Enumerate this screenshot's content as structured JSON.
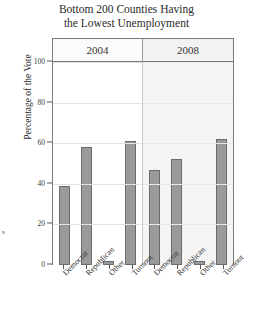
{
  "chart_data": {
    "type": "bar",
    "title": "Bottom 200 Counties Having the Lowest Unemployment",
    "title_lines": [
      "Bottom 200 Counties Having",
      "the Lowest Unemployment"
    ],
    "xlabel": "",
    "ylabel": "Percentage of the Vote",
    "ylim": [
      0,
      100
    ],
    "yticks": [
      0,
      20,
      40,
      60,
      80,
      100
    ],
    "ytick_labels": [
      "0",
      "20",
      "40",
      "60",
      "80",
      "100"
    ],
    "grid": true,
    "legend": "none",
    "categories": [
      "Democrat",
      "Republican",
      "Other",
      "Turnout"
    ],
    "panels": [
      {
        "label": "2004",
        "values": [
          39,
          58,
          2,
          61
        ]
      },
      {
        "label": "2008",
        "values": [
          47,
          52,
          2,
          62
        ]
      }
    ],
    "series": [
      {
        "name": "2004",
        "values": [
          39,
          58,
          2,
          61
        ]
      },
      {
        "name": "2008",
        "values": [
          47,
          52,
          2,
          62
        ]
      }
    ],
    "bar_color": "#9a9a9a",
    "bar_border_color": "#6b6b6b",
    "panel_background_2004": "#ffffff",
    "panel_background_2008": "#f4f4f4"
  },
  "annotations": {
    "stray_text": "s"
  }
}
